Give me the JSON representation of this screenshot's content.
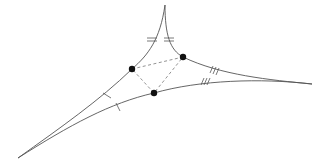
{
  "diagram": {
    "type": "ideal-triangle-with-midpoint-triangle",
    "colors": {
      "edge": "#555555",
      "dash": "#777777",
      "point": "#111111",
      "background": "#ffffff"
    },
    "cusps": {
      "top": [
        165,
        5
      ],
      "left": [
        18,
        158
      ],
      "right": [
        312,
        84
      ]
    },
    "points": [
      {
        "name": "point-left",
        "x": 132,
        "y": 69
      },
      {
        "name": "point-right",
        "x": 183,
        "y": 57
      },
      {
        "name": "point-bottom",
        "x": 154,
        "y": 93
      }
    ],
    "tick_marks": {
      "single": 2,
      "double": 2,
      "triple": 2
    }
  }
}
